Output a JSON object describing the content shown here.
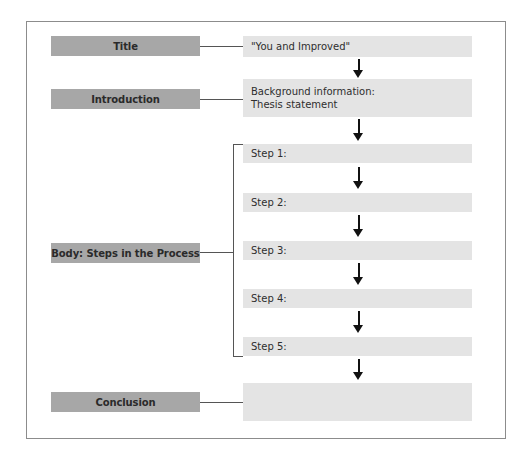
{
  "diagram": {
    "sections": [
      {
        "label": "Title",
        "content": "\"You and Improved\""
      },
      {
        "label": "Introduction",
        "content_lines": [
          "Background information:",
          "Thesis statement"
        ]
      },
      {
        "label": "Body: Steps in the Process",
        "steps": [
          "Step 1:",
          "Step 2:",
          "Step 3:",
          "Step 4:",
          "Step 5:"
        ]
      },
      {
        "label": "Conclusion",
        "content": ""
      }
    ]
  },
  "colors": {
    "label_box": "#a7a7a7",
    "content_box": "#e4e4e4",
    "frame_border": "#8c8c8c",
    "arrow": "#111111"
  }
}
